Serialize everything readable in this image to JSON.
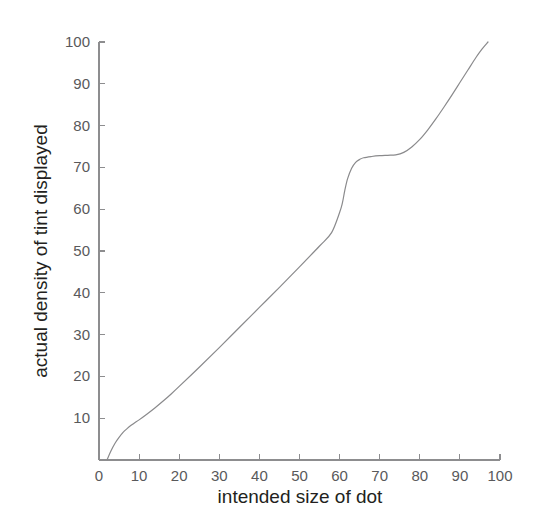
{
  "chart_data": {
    "type": "line",
    "title": "",
    "subtitle": "",
    "xlabel": "intended size of dot",
    "ylabel": "actual density of tint displayed",
    "xlim": [
      0,
      100
    ],
    "ylim": [
      0,
      100
    ],
    "xticks": [
      0,
      10,
      20,
      30,
      40,
      50,
      60,
      70,
      80,
      90,
      100
    ],
    "yticks": [
      0,
      10,
      20,
      30,
      40,
      50,
      60,
      70,
      80,
      90,
      100
    ],
    "xtick_labels": [
      "0",
      "10",
      "20",
      "30",
      "40",
      "50",
      "60",
      "70",
      "80",
      "90",
      "100"
    ],
    "ytick_labels": [
      "0",
      "10",
      "20",
      "30",
      "40",
      "50",
      "60",
      "70",
      "80",
      "90",
      "100"
    ],
    "grid": false,
    "legend": false,
    "legend_position": "none",
    "annotations": [],
    "series": [
      {
        "name": "dot gain curve",
        "color": "#8a8a8c",
        "line_width": 1.2,
        "x": [
          2.0,
          3.0,
          4.0,
          5.0,
          6.0,
          7.0,
          8.0,
          9.0,
          10.0,
          12.0,
          14.0,
          16.0,
          18.0,
          20.0,
          25.0,
          30.0,
          35.0,
          40.0,
          45.0,
          50.0,
          55.0,
          58.0,
          60.0,
          60.7,
          61.3,
          62.0,
          63.0,
          64.0,
          65.0,
          66.0,
          68.0,
          70.0,
          72.0,
          74.0,
          76.0,
          78.0,
          80.0,
          82.0,
          84.0,
          86.0,
          88.0,
          90.0,
          92.0,
          94.0,
          95.5,
          97.0
        ],
        "y": [
          0.0,
          2.2,
          4.0,
          5.4,
          6.6,
          7.5,
          8.3,
          9.0,
          9.6,
          11.0,
          12.5,
          14.1,
          15.8,
          17.6,
          22.2,
          26.9,
          31.7,
          36.5,
          41.3,
          46.2,
          51.2,
          54.4,
          59.2,
          61.5,
          64.5,
          67.3,
          69.8,
          71.2,
          71.9,
          72.3,
          72.6,
          72.8,
          72.9,
          73.0,
          73.6,
          74.9,
          76.7,
          79.0,
          81.6,
          84.4,
          87.3,
          90.3,
          93.3,
          96.3,
          98.3,
          100.0
        ]
      }
    ]
  },
  "axis": {
    "x_title": "intended size of dot",
    "y_title": "actual density of tint displayed"
  }
}
